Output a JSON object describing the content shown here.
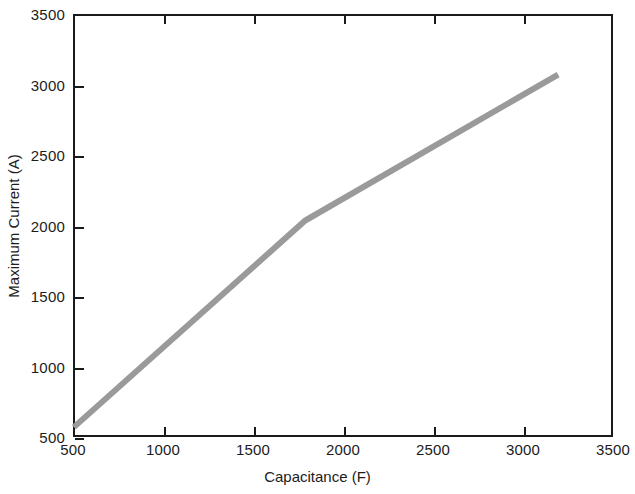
{
  "chart_data": {
    "type": "line",
    "title": "",
    "xlabel": "Capacitance (F)",
    "ylabel": "Maximum Current (A)",
    "xlim": [
      500,
      3500
    ],
    "ylim": [
      500,
      3500
    ],
    "xticks": [
      500,
      1000,
      1500,
      2000,
      2500,
      3000,
      3500
    ],
    "xticklabels": [
      "500",
      "1000",
      "1500",
      "2000",
      "2500",
      "3000",
      "3500"
    ],
    "yticks": [
      500,
      1000,
      1500,
      2000,
      2500,
      3000,
      3500
    ],
    "yticklabels": [
      "500",
      "1000",
      "1500",
      "2000",
      "2500",
      "3000",
      "3500"
    ],
    "grid": false,
    "legend": null,
    "series": [
      {
        "name": "Maximum Current vs Capacitance",
        "color": "#9a9a9a",
        "linewidth": 6,
        "x": [
          505,
          1790,
          3195
        ],
        "y": [
          570,
          2035,
          3070
        ]
      }
    ]
  },
  "axes": {
    "x_title": "Capacitance (F)",
    "y_title": "Maximum Current (A)"
  }
}
